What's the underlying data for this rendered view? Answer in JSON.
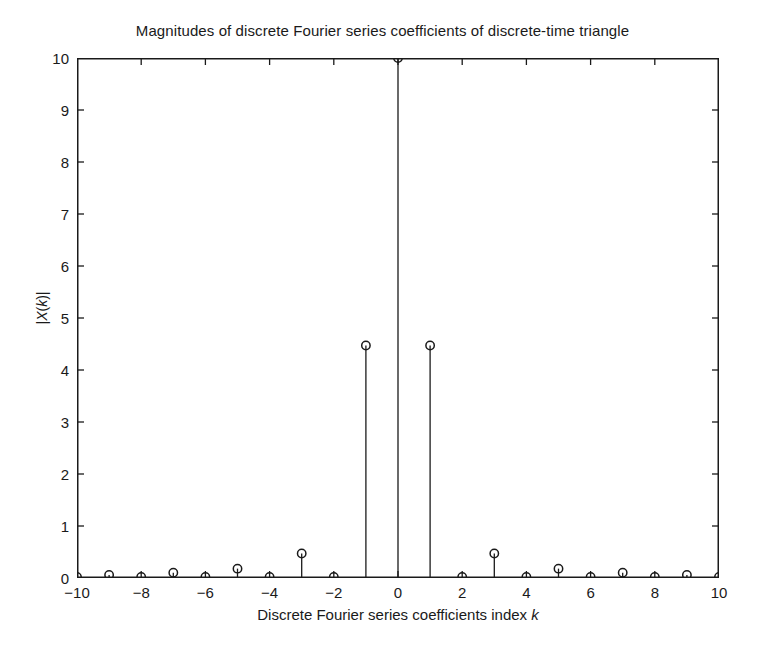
{
  "figure": {
    "title": "Magnitudes of discrete Fourier series coefficients of discrete-time triangle",
    "background_color": "#ffffff",
    "line_color": "#1a1a1a",
    "marker_shape": "circle-open"
  },
  "axes": {
    "xlabel_prefix": "Discrete Fourier series coefficients index ",
    "xlabel_symbol": "k",
    "ylabel_prefix": "|",
    "ylabel_symbol": "X",
    "ylabel_mid": "(",
    "ylabel_symbol2": "k",
    "ylabel_suffix": ")|",
    "ylabel_plain": "|X(k)|",
    "xlabel_plain": "Discrete Fourier series coefficients index k",
    "xticks": [
      -10,
      -8,
      -6,
      -4,
      -2,
      0,
      2,
      4,
      6,
      8,
      10
    ],
    "yticks": [
      0,
      1,
      2,
      3,
      4,
      5,
      6,
      7,
      8,
      9,
      10
    ],
    "xlim": [
      -10,
      10
    ],
    "ylim": [
      0,
      10
    ],
    "grid": false,
    "box": true,
    "tick_direction": "in"
  },
  "chart_data": {
    "type": "line",
    "plot_style": "stem",
    "title": "Magnitudes of discrete Fourier series coefficients of discrete-time triangle",
    "xlabel": "Discrete Fourier series coefficients index k",
    "ylabel": "|X(k)|",
    "xlim": [
      -10,
      10
    ],
    "ylim": [
      0,
      10
    ],
    "grid": false,
    "legend": null,
    "x": [
      -10,
      -9,
      -8,
      -7,
      -6,
      -5,
      -4,
      -3,
      -2,
      -1,
      0,
      1,
      2,
      3,
      4,
      5,
      6,
      7,
      8,
      9,
      10
    ],
    "values": [
      0.02,
      0.06,
      0.02,
      0.1,
      0.02,
      0.18,
      0.02,
      0.47,
      0.02,
      4.47,
      10.0,
      4.47,
      0.02,
      0.47,
      0.02,
      0.18,
      0.02,
      0.1,
      0.02,
      0.06,
      0.02
    ],
    "categories": [
      "-10",
      "-9",
      "-8",
      "-7",
      "-6",
      "-5",
      "-4",
      "-3",
      "-2",
      "-1",
      "0",
      "1",
      "2",
      "3",
      "4",
      "5",
      "6",
      "7",
      "8",
      "9",
      "10"
    ]
  }
}
